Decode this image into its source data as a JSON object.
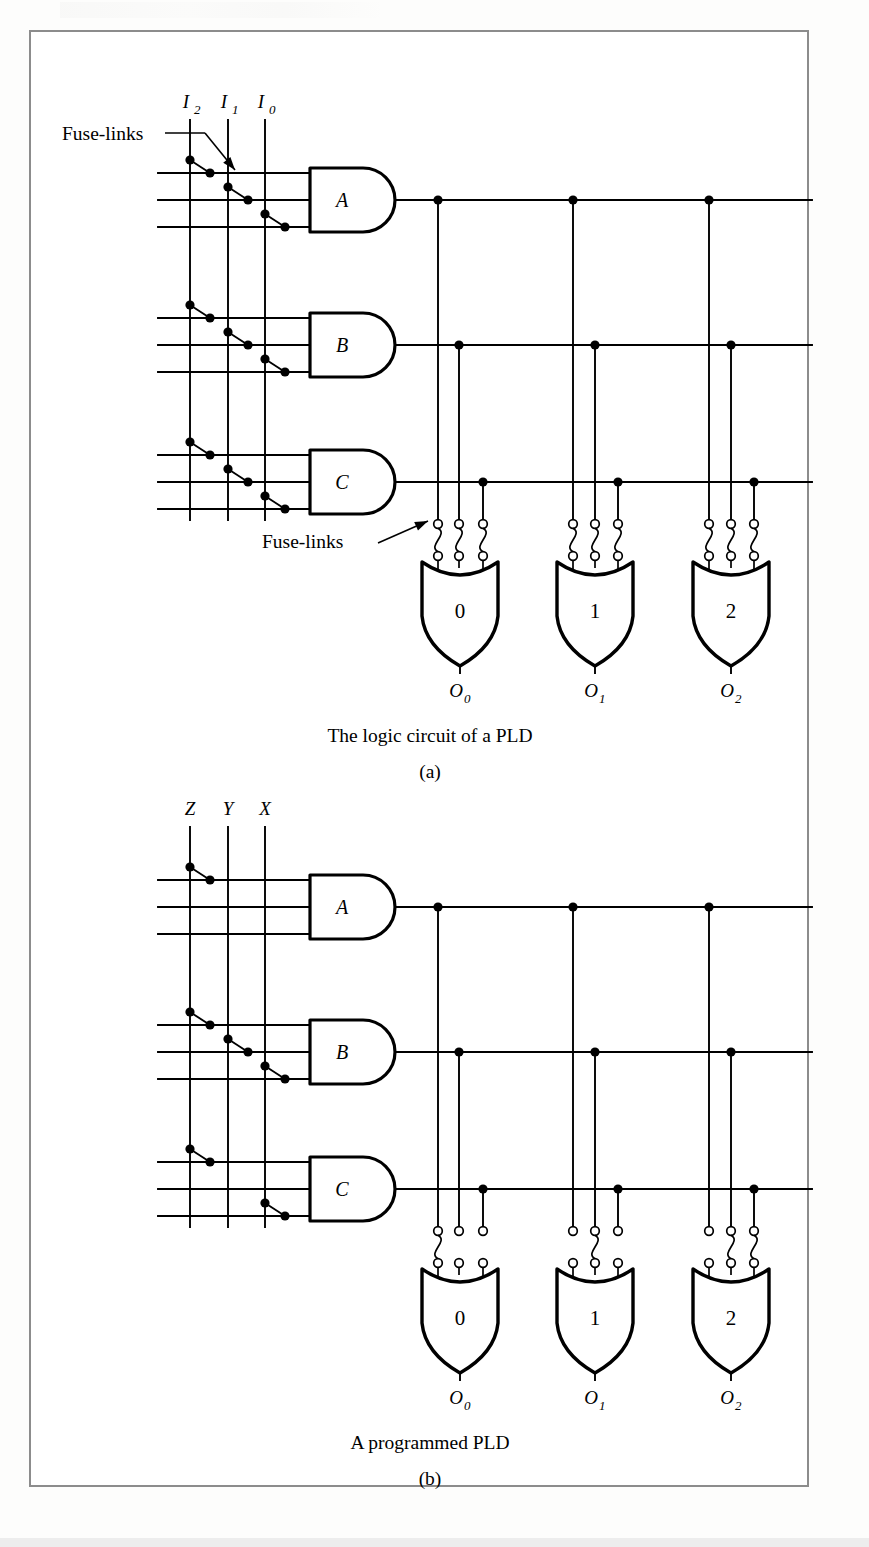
{
  "figure": {
    "border_color": "#8c8c8c",
    "background": "#ffffff",
    "ink_color": "#000000"
  },
  "panels": [
    {
      "id": "a",
      "caption": "The logic circuit of a PLD",
      "sub_caption": "(a)",
      "input_labels": [
        {
          "base": "I",
          "sub": "2"
        },
        {
          "base": "I",
          "sub": "1"
        },
        {
          "base": "I",
          "sub": "0"
        }
      ],
      "and_gates": [
        {
          "label": "A",
          "fuses": [
            1,
            2,
            3
          ]
        },
        {
          "label": "B",
          "fuses": [
            1,
            2,
            3
          ]
        },
        {
          "label": "C",
          "fuses": [
            1,
            2,
            3
          ]
        }
      ],
      "or_gates": [
        {
          "label": "0",
          "output": {
            "base": "O",
            "sub": "0"
          },
          "intact_fuses": [
            1,
            2,
            3
          ]
        },
        {
          "label": "1",
          "output": {
            "base": "O",
            "sub": "1"
          },
          "intact_fuses": [
            1,
            2,
            3
          ]
        },
        {
          "label": "2",
          "output": {
            "base": "O",
            "sub": "2"
          },
          "intact_fuses": [
            1,
            2,
            3
          ]
        }
      ],
      "annotations": [
        {
          "text": "Fuse-links",
          "target": "and-array"
        },
        {
          "text": "Fuse-links",
          "target": "or-array"
        }
      ]
    },
    {
      "id": "b",
      "caption": "A programmed PLD",
      "sub_caption": "(b)",
      "input_labels": [
        {
          "base": "Z",
          "sub": ""
        },
        {
          "base": "Y",
          "sub": ""
        },
        {
          "base": "X",
          "sub": ""
        }
      ],
      "and_gates": [
        {
          "label": "A",
          "fuses": [
            1
          ]
        },
        {
          "label": "B",
          "fuses": [
            1,
            2,
            3
          ]
        },
        {
          "label": "C",
          "fuses": [
            1,
            3
          ]
        }
      ],
      "or_gates": [
        {
          "label": "0",
          "output": {
            "base": "O",
            "sub": "0"
          },
          "intact_fuses": [
            1
          ]
        },
        {
          "label": "1",
          "output": {
            "base": "O",
            "sub": "1"
          },
          "intact_fuses": [
            2
          ]
        },
        {
          "label": "2",
          "output": {
            "base": "O",
            "sub": "2"
          },
          "intact_fuses": [
            2,
            3
          ]
        }
      ],
      "annotations": []
    }
  ],
  "geometry": {
    "panel_a_origin_y": 0,
    "panel_b_origin_y": 707,
    "input_line_x": [
      190,
      228,
      265
    ],
    "and_gate_left": 310,
    "and_gate_right": 395,
    "and_row_y_offsets": [
      -27,
      0,
      27
    ],
    "and_gate_center_y": [
      200,
      345,
      482
    ],
    "row_left_x": 158,
    "or_group_x": [
      [
        438,
        459,
        483
      ],
      [
        573,
        595,
        618
      ],
      [
        709,
        731,
        754
      ]
    ],
    "or_gate_center_x": [
      460,
      595,
      731
    ],
    "or_gate_top_y": 562,
    "or_gate_bottom_y": 650,
    "or_output_label_y": 697,
    "fuse_top_y": 524,
    "fuse_bottom_y": 556,
    "bus_right_x": 812
  }
}
